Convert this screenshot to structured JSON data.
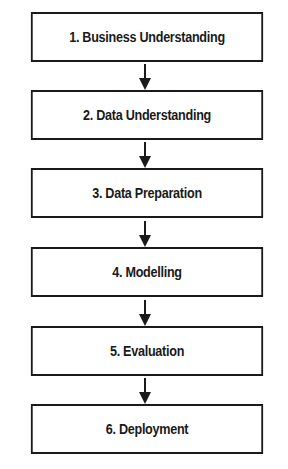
{
  "steps": [
    {
      "label": "1. Business Understanding"
    },
    {
      "label": "2. Data Understanding"
    },
    {
      "label": "3. Data Preparation"
    },
    {
      "label": "4. Modelling"
    },
    {
      "label": "5. Evaluation"
    },
    {
      "label": "6. Deployment"
    }
  ],
  "colors": {
    "stroke": "#1a1a1a",
    "background": "#ffffff"
  }
}
